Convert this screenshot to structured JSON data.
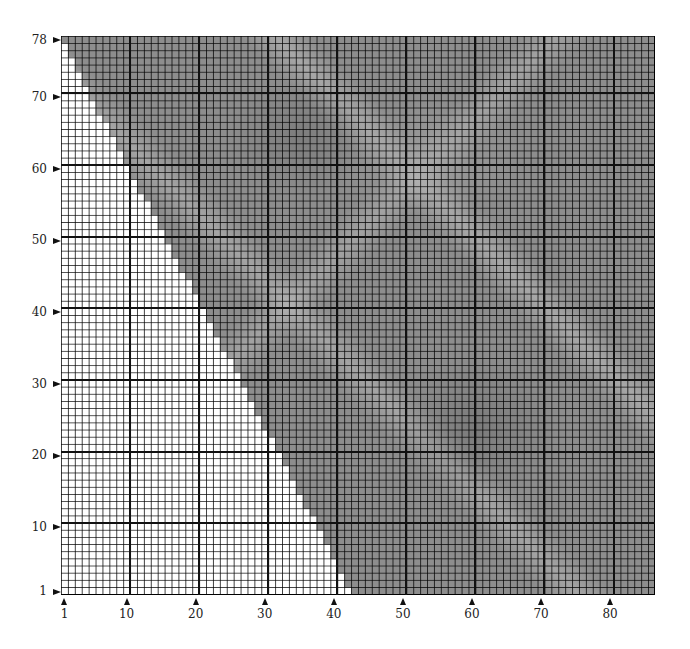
{
  "chart": {
    "columns": 86,
    "rows": 78,
    "major_every": 10,
    "fill_color": "#8d8d8d",
    "empty_color": "#ffffff",
    "grid_color": "#000000",
    "boundary": {
      "description": "Shaded region lies to the right of a stepped diagonal edge; at row 1 shading begins near column 43, at row 78 shading begins at column 1",
      "row_1_first_filled_col": 43,
      "row_78_first_filled_col": 1
    }
  },
  "y_axis": {
    "labels": [
      {
        "text": "78",
        "row": 78
      },
      {
        "text": "70",
        "row": 70
      },
      {
        "text": "60",
        "row": 60
      },
      {
        "text": "50",
        "row": 50
      },
      {
        "text": "40",
        "row": 40
      },
      {
        "text": "30",
        "row": 30
      },
      {
        "text": "20",
        "row": 20
      },
      {
        "text": "10",
        "row": 10
      },
      {
        "text": "1",
        "row": 1
      }
    ]
  },
  "x_axis": {
    "labels": [
      {
        "text": "1",
        "col": 1
      },
      {
        "text": "10",
        "col": 10
      },
      {
        "text": "20",
        "col": 20
      },
      {
        "text": "30",
        "col": 30
      },
      {
        "text": "40",
        "col": 40
      },
      {
        "text": "50",
        "col": 50
      },
      {
        "text": "60",
        "col": 60
      },
      {
        "text": "70",
        "col": 70
      },
      {
        "text": "80",
        "col": 80
      }
    ]
  }
}
